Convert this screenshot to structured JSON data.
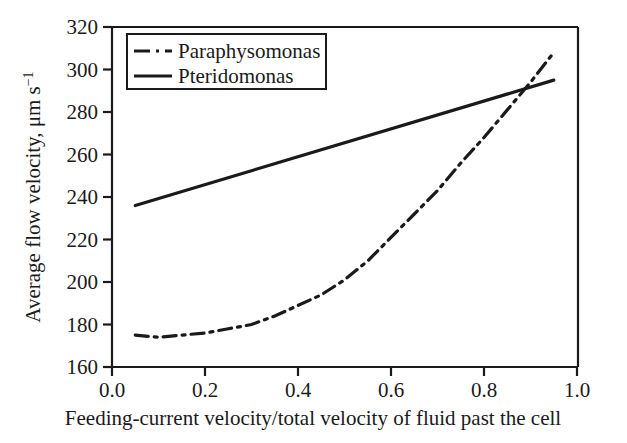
{
  "chart_data": {
    "type": "line",
    "title": "",
    "xlabel": "Feeding-current velocity/total velocity of fluid past the cell",
    "ylabel": "Average flow velocity, μm s",
    "ylabel_exponent": "−1",
    "xlim": [
      0.0,
      1.0
    ],
    "ylim": [
      160,
      320
    ],
    "xticks": [
      "0.0",
      "0.2",
      "0.4",
      "0.6",
      "0.8",
      "1.0"
    ],
    "xtick_values": [
      0.0,
      0.2,
      0.4,
      0.6,
      0.8,
      1.0
    ],
    "yticks": [
      "160",
      "180",
      "200",
      "220",
      "240",
      "260",
      "280",
      "300",
      "320"
    ],
    "ytick_values": [
      160,
      180,
      200,
      220,
      240,
      260,
      280,
      300,
      320
    ],
    "grid": false,
    "legend_position": "upper-left-inside",
    "legend_frame": true,
    "series": [
      {
        "name": "Paraphysomonas",
        "style": "dash-dot",
        "color": "#1a1a1a",
        "x": [
          0.05,
          0.1,
          0.15,
          0.2,
          0.25,
          0.3,
          0.35,
          0.4,
          0.45,
          0.5,
          0.55,
          0.6,
          0.65,
          0.7,
          0.75,
          0.8,
          0.85,
          0.9,
          0.95
        ],
        "y": [
          175,
          174,
          175,
          176,
          178,
          180,
          184,
          189,
          194,
          201,
          210,
          221,
          232,
          243,
          256,
          268,
          281,
          294,
          308
        ]
      },
      {
        "name": "Pteridomonas",
        "style": "solid",
        "color": "#1a1a1a",
        "x": [
          0.05,
          0.95
        ],
        "y": [
          236,
          295
        ]
      }
    ],
    "annotations": [
      {
        "text": "curves cross",
        "x": 0.9,
        "y": 293
      }
    ]
  },
  "legend": {
    "entries": [
      {
        "label": "Paraphysomonas",
        "marker": "dash-dot-line"
      },
      {
        "label": "Pteridomonas",
        "marker": "solid-line"
      }
    ]
  },
  "axes": {
    "y_label_text": "Average flow velocity, μm s",
    "y_label_exponent": "−1",
    "x_label_text": "Feeding-current velocity/total velocity of fluid past the cell"
  },
  "ticks": {
    "y": [
      "320",
      "300",
      "280",
      "260",
      "240",
      "220",
      "200",
      "180",
      "160"
    ],
    "x": [
      "0.0",
      "0.2",
      "0.4",
      "0.6",
      "0.8",
      "1.0"
    ]
  }
}
